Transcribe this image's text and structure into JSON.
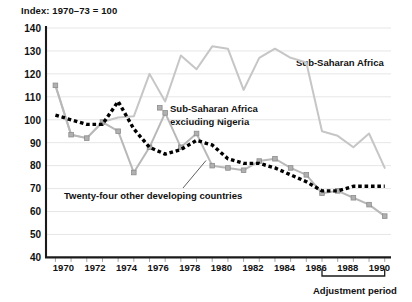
{
  "chart_data": {
    "type": "line",
    "title": "Index: 1970–73 = 100",
    "xlabel": "",
    "ylabel": "",
    "xlim": [
      1969.4,
      1991.4
    ],
    "ylim": [
      40,
      140
    ],
    "ytick_step": 10,
    "yticks": [
      40,
      50,
      60,
      70,
      80,
      90,
      100,
      110,
      120,
      130,
      140
    ],
    "xticks": [
      1970,
      1972,
      1974,
      1976,
      1978,
      1980,
      1982,
      1984,
      1986,
      1988,
      1990
    ],
    "xticks_minor": [
      1971,
      1973,
      1975,
      1977,
      1979,
      1981,
      1983,
      1985,
      1987,
      1989,
      1991
    ],
    "grid": "horizontal",
    "legend_position": "inline-annotations",
    "x": [
      1970,
      1971,
      1972,
      1973,
      1974,
      1975,
      1976,
      1977,
      1978,
      1979,
      1980,
      1981,
      1982,
      1983,
      1984,
      1985,
      1986,
      1987,
      1988,
      1989,
      1990,
      1991
    ],
    "series": [
      {
        "name": "Sub-Saharan Africa",
        "color": "#c6c6c6",
        "marker": "none",
        "style": "solid",
        "values": [
          115,
          93.5,
          92,
          99,
          101,
          101.5,
          120,
          108,
          128,
          122,
          132,
          131,
          113,
          127,
          131,
          127,
          125,
          95,
          93,
          88,
          94,
          79
        ]
      },
      {
        "name": "Sub-Saharan Africa excluding Nigeria",
        "color": "#b8b8b8",
        "marker": "square",
        "style": "solid",
        "values": [
          115,
          93.5,
          92,
          99,
          95,
          77,
          88,
          103,
          88,
          94,
          80,
          79,
          78,
          82,
          83,
          79,
          76,
          68,
          69,
          66,
          63,
          58
        ]
      },
      {
        "name": "Twenty-four other developing countries",
        "color": "#000000",
        "marker": "none",
        "style": "dotted",
        "values": [
          102,
          100,
          98,
          98,
          108,
          96,
          88,
          85,
          87,
          91,
          89,
          83,
          81,
          81,
          79,
          76,
          73,
          69,
          69,
          71,
          71,
          71
        ]
      }
    ],
    "annotations": [
      {
        "name": "sub-saharan-africa-label",
        "text": "Sub-Saharan Africa",
        "x": 1986.6,
        "y": 120.5
      },
      {
        "name": "sub-saharan-excl-nigeria-label",
        "line1": "Sub-Saharan Africa",
        "line2": "excluding Nigeria",
        "x": 1977.6,
        "y": 101.5
      },
      {
        "name": "twenty-four-others-label",
        "text": "Twenty-four other developing countries",
        "x": 1972.0,
        "y": 68.0
      },
      {
        "name": "adjustment-period-label",
        "text": "Adjustment period",
        "x": 1989.0,
        "y": 36.0
      }
    ],
    "bracket": {
      "label": "Adjustment period",
      "start": 1987,
      "end": 1991
    }
  }
}
